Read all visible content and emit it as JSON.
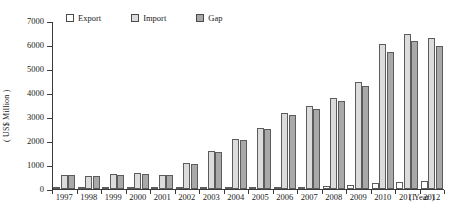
{
  "chart_data": {
    "type": "bar",
    "title": "",
    "xlabel": "( Year )",
    "ylabel": "( US$ Million )",
    "ylim": [
      0,
      7000
    ],
    "ytick_values": [
      0,
      1000,
      2000,
      3000,
      4000,
      5000,
      6000,
      7000
    ],
    "ytick_labels": [
      "0",
      "1000",
      "2000",
      "3000",
      "4000",
      "5000",
      "6000",
      "7000"
    ],
    "grid": false,
    "legend_position": "top-left",
    "categories": [
      "1997",
      "1998",
      "1999",
      "2000",
      "2001",
      "2002",
      "2003",
      "2004",
      "2005",
      "2006",
      "2007",
      "2008",
      "2009",
      "2010",
      "2011",
      "2012"
    ],
    "series": [
      {
        "name": "Export",
        "color": "#ffffff",
        "values": [
          30,
          25,
          30,
          35,
          30,
          40,
          50,
          60,
          70,
          80,
          100,
          120,
          150,
          260,
          300,
          330
        ]
      },
      {
        "name": "Import",
        "color": "#dcdcdc",
        "values": [
          600,
          560,
          620,
          680,
          600,
          1100,
          1600,
          2100,
          2550,
          3150,
          3450,
          3800,
          4450,
          6050,
          6450,
          6300
        ]
      },
      {
        "name": "Gap",
        "color": "#a9a9a9",
        "values": [
          570,
          535,
          590,
          645,
          570,
          1060,
          1550,
          2040,
          2480,
          3070,
          3350,
          3680,
          4300,
          5700,
          6150,
          5970
        ]
      }
    ]
  },
  "legend": {
    "items": [
      {
        "label": "Export",
        "swatch": "#ffffff"
      },
      {
        "label": "Import",
        "swatch": "#dcdcdc"
      },
      {
        "label": "Gap",
        "swatch": "#a9a9a9"
      }
    ]
  }
}
